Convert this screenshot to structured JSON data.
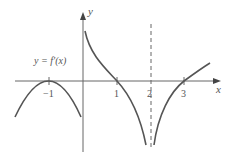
{
  "diagram": {
    "function_label": "y = f′(x)",
    "axis_labels": {
      "x": "x",
      "y": "y"
    },
    "ticks": [
      {
        "value": -1,
        "label": "−1"
      },
      {
        "value": 1,
        "label": "1"
      },
      {
        "value": 2,
        "label": "2"
      },
      {
        "value": 3,
        "label": "3"
      }
    ],
    "asymptote": {
      "x": 2,
      "style": "dashed"
    },
    "colors": {
      "curve": "#555555",
      "axis": "#666666"
    }
  }
}
